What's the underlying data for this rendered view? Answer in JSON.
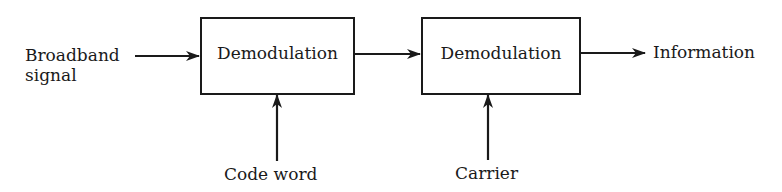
{
  "diagram": {
    "title": "",
    "colors": {
      "stroke": "#1a1a1a",
      "background": "#ffffff"
    },
    "inputs": {
      "broadband_line1": "Broadband",
      "broadband_line2": "signal",
      "code_word": "Code word",
      "carrier": "Carrier"
    },
    "blocks": [
      {
        "id": "block-1",
        "label": "Demodulation"
      },
      {
        "id": "block-2",
        "label": "Demodulation"
      }
    ],
    "output": {
      "label": "Information"
    },
    "connections": [
      {
        "from": "Broadband signal",
        "to": "block-1",
        "direction": "right"
      },
      {
        "from": "Code word",
        "to": "block-1",
        "direction": "up"
      },
      {
        "from": "block-1",
        "to": "block-2",
        "direction": "right"
      },
      {
        "from": "Carrier",
        "to": "block-2",
        "direction": "up"
      },
      {
        "from": "block-2",
        "to": "Information",
        "direction": "right"
      }
    ]
  }
}
